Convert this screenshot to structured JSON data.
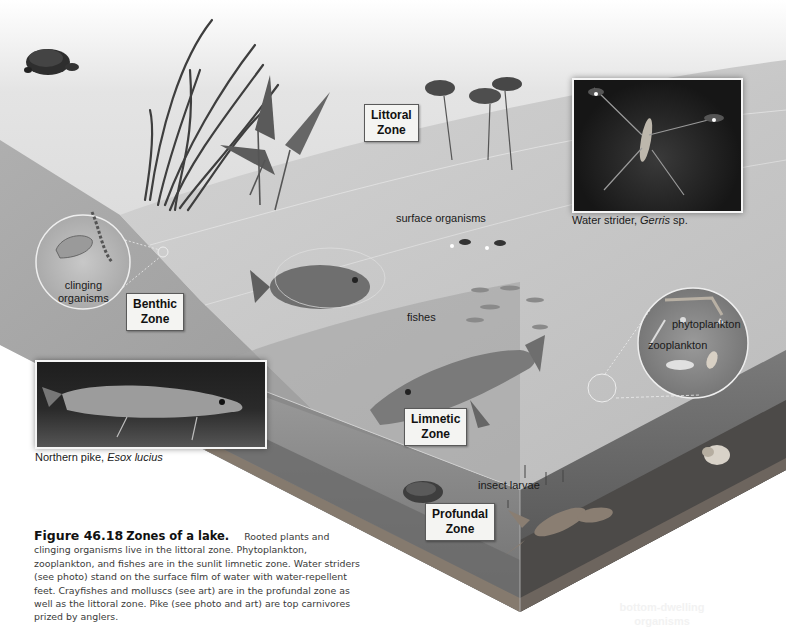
{
  "zones": {
    "littoral": "Littoral\nZone",
    "benthic": "Benthic\nZone",
    "limnetic": "Limnetic\nZone",
    "profundal": "Profundal\nZone"
  },
  "labels": {
    "surface_organisms": "surface organisms",
    "fishes": "fishes",
    "clinging_organisms": "clinging\norganisms",
    "phytoplankton": "phytoplankton",
    "zooplankton": "zooplankton",
    "insect_larvae": "insect larvae",
    "bottom_dwelling": "bottom-dwelling\norganisms"
  },
  "photos": {
    "water_strider": {
      "common_name": "Water strider,",
      "scientific_name": "Gerris",
      "suffix": "sp."
    },
    "northern_pike": {
      "common_name": "Northern pike,",
      "scientific_name": "Esox lucius"
    }
  },
  "illustrations": {
    "animals": [
      "turtle-icon",
      "bass-fish-icon",
      "minnow-school-icon",
      "pike-fish-icon",
      "water-strider-icon",
      "crayfish-icon",
      "clam-icon",
      "snail-icon",
      "insect-larva-icon"
    ],
    "plants": [
      "reed-plant-icon",
      "arrowhead-plant-icon",
      "water-lily-icon"
    ]
  },
  "caption": {
    "figure_number": "Figure 46.18",
    "title": "Zones of a lake.",
    "body": "Rooted plants and clinging organisms live in the littoral zone. Phytoplankton, zooplankton, and fishes are in the sunlit limnetic zone. Water striders (see photo) stand on the surface film of water with water-repellent feet. Crayfishes and molluscs (see art) are in the profundal zone as well as the littoral zone. Pike (see photo and art) are top carnivores prized by anglers."
  },
  "colors": {
    "shore": "#bdbdbd",
    "water_surface": "#c9c9c9",
    "water_side": "#8e8e8e",
    "deep_side": "#5e5e5e",
    "sediment": "#6b6560"
  }
}
